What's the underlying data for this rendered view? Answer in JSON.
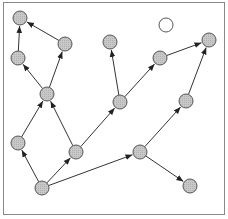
{
  "diagram": {
    "type": "directed-graph",
    "frame": {
      "x": 3,
      "y": 2,
      "width": 221,
      "height": 212
    },
    "colors": {
      "edge": "#333333",
      "node_fill": "#c4c4c4",
      "node_stroke": "#555555",
      "frame": "#888888",
      "empty_fill": "#ffffff"
    },
    "nodes": [
      {
        "id": "A",
        "x": 20,
        "y": 18,
        "filled": true
      },
      {
        "id": "B",
        "x": 65,
        "y": 44,
        "filled": true
      },
      {
        "id": "C",
        "x": 18,
        "y": 58,
        "filled": true
      },
      {
        "id": "D",
        "x": 47,
        "y": 94,
        "filled": true
      },
      {
        "id": "E",
        "x": 110,
        "y": 42,
        "filled": true
      },
      {
        "id": "F",
        "x": 120,
        "y": 102,
        "filled": true
      },
      {
        "id": "G",
        "x": 160,
        "y": 58,
        "filled": true
      },
      {
        "id": "H",
        "x": 209,
        "y": 40,
        "filled": true
      },
      {
        "id": "I",
        "x": 166,
        "y": 25,
        "filled": false
      },
      {
        "id": "J",
        "x": 18,
        "y": 143,
        "filled": true
      },
      {
        "id": "K",
        "x": 76,
        "y": 152,
        "filled": true
      },
      {
        "id": "L",
        "x": 186,
        "y": 101,
        "filled": true
      },
      {
        "id": "M",
        "x": 140,
        "y": 152,
        "filled": true
      },
      {
        "id": "N",
        "x": 42,
        "y": 188,
        "filled": true
      },
      {
        "id": "O",
        "x": 190,
        "y": 186,
        "filled": true
      }
    ],
    "edges": [
      {
        "from": "B",
        "to": "A"
      },
      {
        "from": "C",
        "to": "A"
      },
      {
        "from": "D",
        "to": "C"
      },
      {
        "from": "D",
        "to": "B"
      },
      {
        "from": "J",
        "to": "D"
      },
      {
        "from": "K",
        "to": "D"
      },
      {
        "from": "N",
        "to": "J"
      },
      {
        "from": "N",
        "to": "K"
      },
      {
        "from": "N",
        "to": "M"
      },
      {
        "from": "K",
        "to": "F"
      },
      {
        "from": "F",
        "to": "E"
      },
      {
        "from": "F",
        "to": "G"
      },
      {
        "from": "G",
        "to": "H"
      },
      {
        "from": "M",
        "to": "L"
      },
      {
        "from": "L",
        "to": "H"
      },
      {
        "from": "M",
        "to": "O"
      }
    ]
  }
}
